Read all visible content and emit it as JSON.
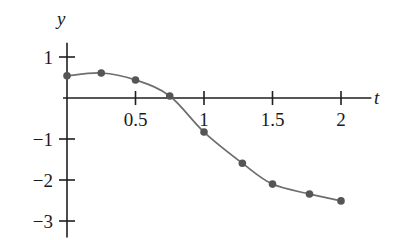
{
  "chart_data": {
    "type": "line",
    "title": "",
    "subtitle": "",
    "xlabel": "t",
    "ylabel": "y",
    "xlim": [
      -0.06,
      2.2
    ],
    "ylim": [
      -3.4,
      1.35
    ],
    "grid": false,
    "legend": null,
    "marker": "filled-circle",
    "series": [
      {
        "name": "y(t)",
        "x": [
          0,
          0.25,
          0.5,
          0.75,
          1.0,
          1.28,
          1.5,
          1.77,
          2.0
        ],
        "y": [
          0.54,
          0.61,
          0.44,
          0.05,
          -0.83,
          -1.59,
          -2.1,
          -2.34,
          -2.51
        ]
      }
    ],
    "x_ticks": [
      {
        "value": 0.5,
        "label": "0.5"
      },
      {
        "value": 1.0,
        "label": "1"
      },
      {
        "value": 1.5,
        "label": "1.5"
      },
      {
        "value": 2.0,
        "label": "2"
      }
    ],
    "y_ticks": [
      {
        "value": 1,
        "label": "1"
      },
      {
        "value": -1,
        "label": "−1"
      },
      {
        "value": -2,
        "label": "−2"
      },
      {
        "value": -3,
        "label": "−3"
      }
    ],
    "colors": {
      "axis": "#1f1f1f",
      "curve": "#6e6e6e",
      "marker": "#555555",
      "text": "#1a1a1a",
      "background": "#ffffff"
    }
  },
  "labels": {
    "y_axis_name": "y",
    "t_axis_name": "t"
  }
}
